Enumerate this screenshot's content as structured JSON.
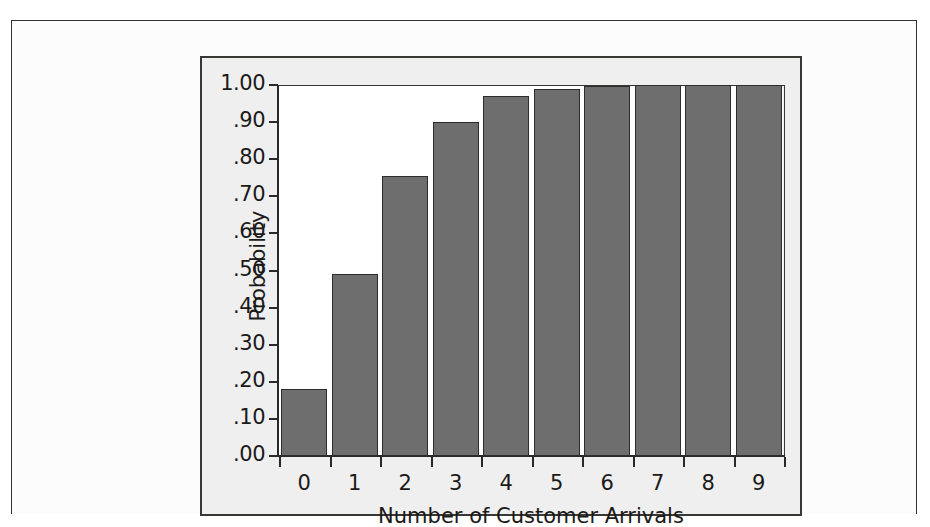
{
  "chart_data": {
    "type": "bar",
    "title": "",
    "subtitle": "",
    "xlabel": "Number of Customer Arrivals",
    "ylabel": "Probability",
    "categories": [
      "0",
      "1",
      "2",
      "3",
      "4",
      "5",
      "6",
      "7",
      "8",
      "9"
    ],
    "values": [
      0.18,
      0.49,
      0.755,
      0.9,
      0.97,
      0.99,
      0.997,
      0.999,
      1.0,
      1.0
    ],
    "ylim": [
      0.0,
      1.0
    ],
    "ytick_values": [
      0.0,
      0.1,
      0.2,
      0.3,
      0.4,
      0.5,
      0.6,
      0.7,
      0.8,
      0.9,
      1.0
    ],
    "ytick_labels": [
      ".00",
      ".10",
      ".20",
      ".30",
      ".40",
      ".50",
      ".60",
      ".70",
      ".80",
      ".90",
      "1.00"
    ],
    "grid": false,
    "legend": null,
    "bar_color": "#6e6e6e",
    "bar_edge_color": "#2f2d2b",
    "plot_background": "#ffffff",
    "figure_background": "#efefef",
    "page_background": "#fcfcfc",
    "axis_color": "#2b2927"
  }
}
